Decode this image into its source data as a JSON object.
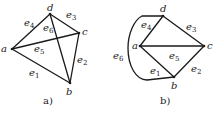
{
  "figure_a": {
    "caption": "a)",
    "vertices": {
      "a": "a",
      "b": "b",
      "c": "c",
      "d": "d"
    },
    "edges": [
      {
        "id": "e1",
        "base": "e",
        "sub": "1",
        "from": "a",
        "to": "b"
      },
      {
        "id": "e2",
        "base": "e",
        "sub": "2",
        "from": "c",
        "to": "b"
      },
      {
        "id": "e3",
        "base": "e",
        "sub": "3",
        "from": "d",
        "to": "c"
      },
      {
        "id": "e4",
        "base": "e",
        "sub": "4",
        "from": "a",
        "to": "d"
      },
      {
        "id": "e5",
        "base": "e",
        "sub": "5",
        "from": "a",
        "to": "c"
      },
      {
        "id": "e6",
        "base": "e",
        "sub": "6",
        "from": "d",
        "to": "b"
      }
    ]
  },
  "figure_b": {
    "caption": "b)",
    "vertices": {
      "a": "a",
      "b": "b",
      "c": "c",
      "d": "d"
    },
    "edges": [
      {
        "id": "e1",
        "base": "e",
        "sub": "1",
        "from": "a",
        "to": "b"
      },
      {
        "id": "e2",
        "base": "e",
        "sub": "2",
        "from": "c",
        "to": "b"
      },
      {
        "id": "e3",
        "base": "e",
        "sub": "3",
        "from": "d",
        "to": "c"
      },
      {
        "id": "e4",
        "base": "e",
        "sub": "4",
        "from": "a",
        "to": "d"
      },
      {
        "id": "e5",
        "base": "e",
        "sub": "5",
        "from": "a",
        "to": "c"
      },
      {
        "id": "e6",
        "base": "e",
        "sub": "6",
        "from": "d",
        "to": "b",
        "curved": true
      }
    ]
  }
}
